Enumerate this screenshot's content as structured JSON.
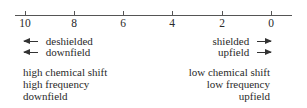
{
  "scale": {
    "ticks": [
      {
        "label": "10",
        "x": 25
      },
      {
        "label": "8",
        "x": 74
      },
      {
        "label": "6",
        "x": 123
      },
      {
        "label": "4",
        "x": 172
      },
      {
        "label": "2",
        "x": 222
      },
      {
        "label": "0",
        "x": 271
      }
    ]
  },
  "left_arrows": {
    "row1": "deshielded",
    "row2": "downfield"
  },
  "right_arrows": {
    "row1": "shielded",
    "row2": "upfield"
  },
  "left_block": {
    "line1": "high chemical shift",
    "line2": "high frequency",
    "line3": "downfield"
  },
  "right_block": {
    "line1": "low chemical shift",
    "line2": "low frequency",
    "line3": "upfield"
  }
}
